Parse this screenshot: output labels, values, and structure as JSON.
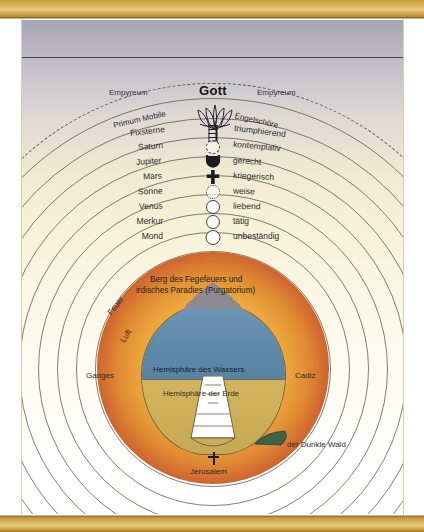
{
  "diagram": {
    "title_center": "Gott",
    "empyrean_left": "Empyreum",
    "empyrean_right": "Empyreum",
    "primum_mobile": "Primum Mobile",
    "angel_choirs": "Engelschöre"
  },
  "spheres": [
    {
      "name": "Fixsterne",
      "attribute": "triumphierend",
      "symbol": "ladder-icon"
    },
    {
      "name": "Saturn",
      "attribute": "kontemplativ",
      "symbol": "saturn-icon"
    },
    {
      "name": "Jupiter",
      "attribute": "gerecht",
      "symbol": "jupiter-icon"
    },
    {
      "name": "Mars",
      "attribute": "kriegerisch",
      "symbol": "mars-cross-icon"
    },
    {
      "name": "Sonne",
      "attribute": "weise",
      "symbol": "sun-disc-icon"
    },
    {
      "name": "Venus",
      "attribute": "liebend",
      "symbol": "venus-disc-icon"
    },
    {
      "name": "Merkur",
      "attribute": "tätig",
      "symbol": "mercury-disc-icon"
    },
    {
      "name": "Mond",
      "attribute": "unbeständig",
      "symbol": "moon-disc-icon"
    }
  ],
  "terrestrial": {
    "purgatory_line1": "Berg des Fegefeuers und",
    "purgatory_line2": "irdisches Paradies (Purgatorium)",
    "element_fire": "Feuer",
    "element_air": "Luft",
    "west_point": "Ganges",
    "east_point": "Cadiz",
    "water_hemisphere": "Hemisphäre des Wassers",
    "earth_hemisphere": "Hemisphäre der Erde",
    "dark_wood": "der Dunkle Wald",
    "jerusalem": "Jerusalem"
  },
  "colors": {
    "sky_purple": "#6b6480",
    "parchment": "#f7f2d8",
    "disc_inner_gold": "#f6c94f",
    "disc_mid_orange": "#eba848",
    "disc_outer_red": "#a8402c",
    "water_blue": "#5f89ab",
    "land_tan": "#cdae58",
    "mountain_grey": "#8d8a91",
    "wood_green": "#3f6148",
    "frame_gold": "#d6ad57"
  }
}
